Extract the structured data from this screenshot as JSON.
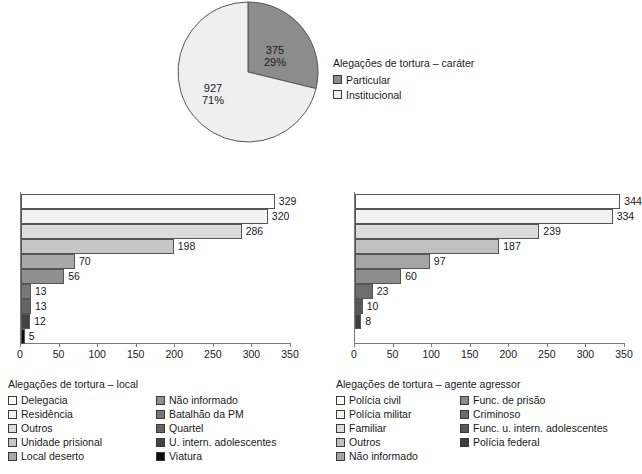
{
  "chart_data": [
    {
      "type": "pie",
      "title": "Alegações de tortura – caráter",
      "categories": [
        "Particular",
        "Institucional"
      ],
      "values": [
        375,
        927
      ],
      "percent_labels": [
        "29%",
        "71%"
      ],
      "value_labels": [
        "375",
        "927"
      ],
      "colors": [
        "#8c8c8c",
        "#efefef"
      ],
      "legend_position": "right",
      "start_angle_deg": 0,
      "direction": "clockwise"
    },
    {
      "type": "bar",
      "orientation": "horizontal",
      "title": "Alegações de tortura – local",
      "categories": [
        "Delegacia",
        "Residência",
        "Outros",
        "Unidade prisional",
        "Local deserto",
        "Não informado",
        "Batalhão da PM",
        "Quartel",
        "U. intern. adolescentes",
        "Viatura"
      ],
      "values": [
        329,
        320,
        286,
        198,
        70,
        56,
        13,
        13,
        12,
        5
      ],
      "colors": [
        "#ffffff",
        "#f2f2f2",
        "#dcdcdc",
        "#c6c6c6",
        "#a8a8a8",
        "#8f8f8f",
        "#787878",
        "#646464",
        "#444444",
        "#0d0d0d"
      ],
      "xlabel": "",
      "ylabel": "",
      "xlim": [
        0,
        350
      ],
      "xticks": [
        0,
        50,
        100,
        150,
        200,
        250,
        300,
        350
      ],
      "grid": false,
      "legend_position": "below"
    },
    {
      "type": "bar",
      "orientation": "horizontal",
      "title": "Alegações de tortura – agente agressor",
      "categories": [
        "Polícia civil",
        "Polícia militar",
        "Familiar",
        "Outros",
        "Não informado",
        "Func. de prisão",
        "Criminoso",
        "Func. u. intern. adolescentes",
        "Polícia federal"
      ],
      "values": [
        344,
        334,
        239,
        187,
        97,
        60,
        23,
        10,
        8
      ],
      "colors": [
        "#ffffff",
        "#f2f2f2",
        "#dcdcdc",
        "#c0c0c0",
        "#a5a5a5",
        "#8c8c8c",
        "#6e6e6e",
        "#585858",
        "#3d3d3d"
      ],
      "xlabel": "",
      "ylabel": "",
      "xlim": [
        0,
        350
      ],
      "xticks": [
        0,
        50,
        100,
        150,
        200,
        250,
        300,
        350
      ],
      "grid": false,
      "legend_position": "below"
    }
  ]
}
